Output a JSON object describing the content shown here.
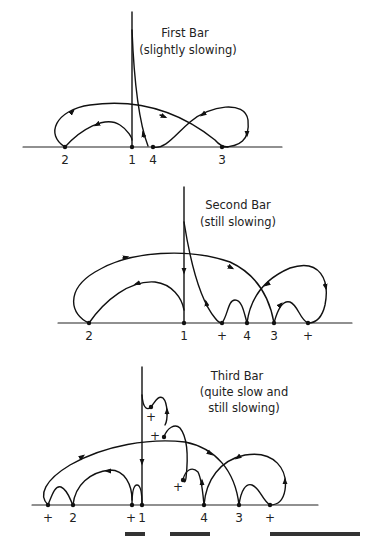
{
  "panels": [
    {
      "title": "First Bar",
      "subtitle": "(slightly slowing)",
      "points": [
        {
          "label": "2",
          "x": 65
        },
        {
          "label": "1",
          "x": 132
        },
        {
          "label": "4",
          "x": 153
        },
        {
          "label": "3",
          "x": 222
        }
      ]
    },
    {
      "title": "Second Bar",
      "subtitle": "(still slowing)",
      "points": [
        {
          "label": "2",
          "x": 89
        },
        {
          "label": "1",
          "x": 184
        },
        {
          "label": "+",
          "x": 222
        },
        {
          "label": "4",
          "x": 247
        },
        {
          "label": "3",
          "x": 274
        },
        {
          "label": "+",
          "x": 308
        }
      ]
    },
    {
      "title": "Third Bar",
      "subtitle_line1": "(quite slow and",
      "subtitle_line2": "still slowing)",
      "points": [
        {
          "label": "+",
          "x": 48
        },
        {
          "label": "2",
          "x": 73
        },
        {
          "label": "+",
          "x": 132
        },
        {
          "label": "1",
          "x": 142
        },
        {
          "label": "4",
          "x": 204
        },
        {
          "label": "3",
          "x": 239
        },
        {
          "label": "+",
          "x": 270
        }
      ],
      "floating_markers": [
        {
          "label": "+",
          "x": 151,
          "y": 418
        },
        {
          "label": "+",
          "x": 155,
          "y": 436
        },
        {
          "label": "+",
          "x": 178,
          "y": 487
        }
      ]
    }
  ]
}
